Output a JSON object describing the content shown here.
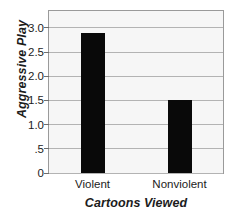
{
  "chart_data": {
    "type": "bar",
    "title": "",
    "subtitle": "",
    "xlabel": "Cartoons Viewed",
    "ylabel": "Aggressive Play",
    "categories": [
      "Violent",
      "Nonviolent"
    ],
    "values": [
      2.9,
      1.52
    ],
    "ylim": [
      0,
      3.35
    ],
    "yticks": [
      0,
      0.5,
      1.0,
      1.5,
      2.0,
      2.5,
      3.0
    ],
    "ytick_labels": [
      "0",
      ".5",
      "1.0",
      "1.5",
      "2.0",
      "2.5",
      "3.0"
    ],
    "grid": true,
    "grid_axis": "y",
    "legend": false,
    "legend_position": "none",
    "bar_color": "#090909",
    "plot_background": "#f6f6f6",
    "grid_color": "#b3b3b3",
    "border_color": "#9a9a9a",
    "text_color": "#1c1c1c",
    "bar_width_fraction": 0.27,
    "annotations": []
  }
}
